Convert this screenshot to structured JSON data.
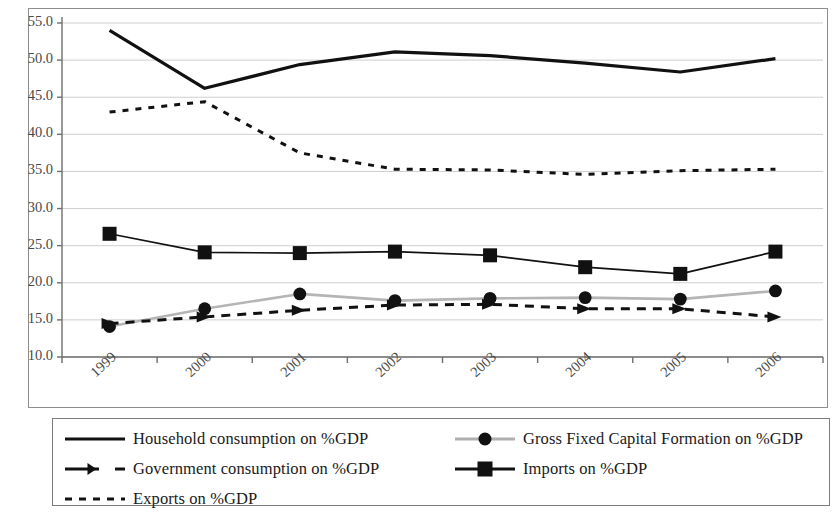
{
  "chart_data": {
    "type": "line",
    "title": "",
    "xlabel": "",
    "ylabel": "",
    "categories": [
      "1999",
      "2000",
      "2001",
      "2002",
      "2003",
      "2004",
      "2005",
      "2006"
    ],
    "ylim": [
      10.0,
      55.0
    ],
    "y_tick_step": 5.0,
    "y_ticks": [
      "10.0",
      "15.0",
      "20.0",
      "25.0",
      "30.0",
      "35.0",
      "40.0",
      "45.0",
      "50.0",
      "55.0"
    ],
    "grid": true,
    "legend_position": "bottom",
    "series": [
      {
        "name": "Household consumption on %GDP",
        "style": "solid-thick",
        "marker": "none",
        "color": "#111111",
        "values": [
          54.0,
          46.2,
          49.4,
          51.1,
          50.6,
          49.6,
          48.4,
          50.2
        ]
      },
      {
        "name": "Gross Fixed Capital Formation on %GDP",
        "style": "solid-gray",
        "marker": "circle",
        "color": "#b0b0b0",
        "marker_color": "#111111",
        "values": [
          14.1,
          16.5,
          18.5,
          17.6,
          17.9,
          18.0,
          17.8,
          18.9
        ]
      },
      {
        "name": "Government consumption on %GDP",
        "style": "dashed",
        "marker": "triangle",
        "color": "#111111",
        "values": [
          14.5,
          15.4,
          16.3,
          17.0,
          17.1,
          16.5,
          16.5,
          15.4
        ]
      },
      {
        "name": "Imports on %GDP",
        "style": "solid",
        "marker": "square",
        "color": "#111111",
        "values": [
          26.6,
          24.1,
          24.0,
          24.2,
          23.7,
          22.1,
          21.2,
          24.2
        ]
      },
      {
        "name": "Exports on %GDP",
        "style": "dotted",
        "marker": "none",
        "color": "#111111",
        "values": [
          43.0,
          44.4,
          37.5,
          35.3,
          35.2,
          34.6,
          35.1,
          35.3
        ]
      }
    ]
  },
  "legend": {
    "entries": [
      {
        "label": "Household consumption on %GDP"
      },
      {
        "label": "Gross Fixed Capital Formation on %GDP"
      },
      {
        "label": "Government consumption on %GDP"
      },
      {
        "label": "Imports on %GDP"
      },
      {
        "label": "Exports on %GDP"
      }
    ]
  }
}
